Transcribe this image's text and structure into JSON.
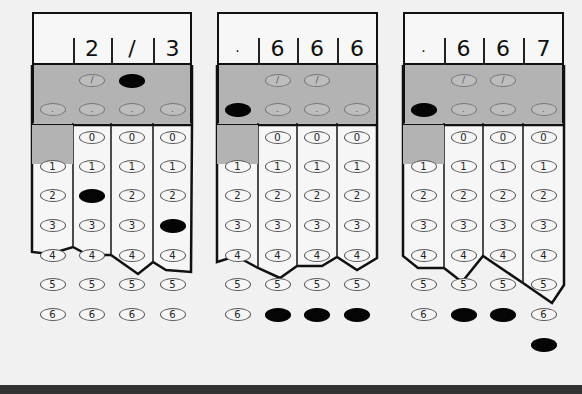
{
  "grids": [
    {
      "name": "grid-answer-2-3",
      "answer": "2/3",
      "header": [
        "",
        "2",
        "/",
        "3"
      ],
      "filled": {
        "col0": null,
        "col1": "2",
        "col2": "/",
        "col3": "3"
      }
    },
    {
      "name": "grid-answer-666",
      "answer": ".666",
      "header": [
        ".",
        "6",
        "6",
        "6"
      ],
      "filled": {
        "col0": ".",
        "col1": "6",
        "col2": "6",
        "col3": "6"
      }
    },
    {
      "name": "grid-answer-667",
      "answer": ".667",
      "header": [
        ".",
        "6",
        "6",
        "7"
      ],
      "filled": {
        "col0": ".",
        "col1": "6",
        "col2": "6",
        "col3": "7"
      }
    }
  ],
  "bubble_labels": {
    "slash": "/",
    "dot": ".",
    "digits": [
      "0",
      "1",
      "2",
      "3",
      "4",
      "5",
      "6",
      "7"
    ]
  },
  "colors": {
    "outline": "#111111",
    "shaded_band": "#b3b3b3",
    "filled_bubble": "#050505",
    "background": "#f1f1f1"
  }
}
